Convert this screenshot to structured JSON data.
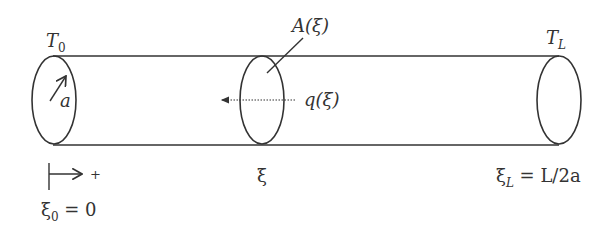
{
  "diagram": {
    "type": "cylinder-heat-flow",
    "labels": {
      "left_temperature": "T",
      "left_temperature_sub": "0",
      "right_temperature": "T",
      "right_temperature_sub": "L",
      "radius": "a",
      "cross_section_area": "A(ξ)",
      "heat_flux": "q(ξ)",
      "direction_plus": "+",
      "origin_symbol": "ξ",
      "origin_sub": "0",
      "origin_value": " = 0",
      "position": "ξ",
      "end_symbol": "ξ",
      "end_sub": "L",
      "end_value": " = L/2a"
    },
    "colors": {
      "stroke": "#333333",
      "background": "#ffffff"
    }
  }
}
